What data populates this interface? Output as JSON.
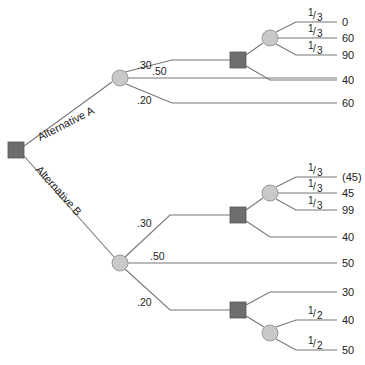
{
  "diagram": {
    "type": "decision-tree",
    "root": {
      "kind": "decision"
    },
    "alternatives": [
      {
        "label": "Alternative A",
        "branches": [
          {
            "prob": ".30",
            "node": "decision",
            "options": [
              {
                "node": "chance",
                "outcomes": [
                  {
                    "prob": "1/3",
                    "value": "0"
                  },
                  {
                    "prob": "1/3",
                    "value": "60"
                  },
                  {
                    "prob": "1/3",
                    "value": "90"
                  }
                ]
              },
              {
                "value": "40"
              }
            ]
          },
          {
            "prob": ".50",
            "value": "44"
          },
          {
            "prob": ".20",
            "value": "60"
          }
        ]
      },
      {
        "label": "Alternative B",
        "branches": [
          {
            "prob": ".30",
            "node": "decision",
            "options": [
              {
                "node": "chance",
                "outcomes": [
                  {
                    "prob": "1/3",
                    "value": "(45)"
                  },
                  {
                    "prob": "1/3",
                    "value": "45"
                  },
                  {
                    "prob": "1/3",
                    "value": "99"
                  }
                ]
              },
              {
                "value": "40"
              }
            ]
          },
          {
            "prob": ".50",
            "value": "50"
          },
          {
            "prob": ".20",
            "node": "decision",
            "options": [
              {
                "value": "30"
              },
              {
                "node": "chance",
                "outcomes": [
                  {
                    "prob": "1/2",
                    "value": "40"
                  },
                  {
                    "prob": "1/2",
                    "value": "50"
                  }
                ]
              }
            ]
          }
        ]
      }
    ]
  },
  "labels": {
    "alt_a": "Alternative A",
    "alt_b": "Alternative B",
    "p30": ".30",
    "p50": ".50",
    "p20": ".20",
    "third_num": "1",
    "third_den": "3",
    "half_num": "1",
    "half_den": "2",
    "a_v0": "0",
    "a_v60": "60",
    "a_v90": "90",
    "a_v40": "40",
    "a_v44": "44",
    "a_v60b": "60",
    "b_v45n": "(45)",
    "b_v45": "45",
    "b_v99": "99",
    "b_v40": "40",
    "b_v50": "50",
    "b_v30": "30",
    "b_v40b": "40",
    "b_v50b": "50"
  }
}
